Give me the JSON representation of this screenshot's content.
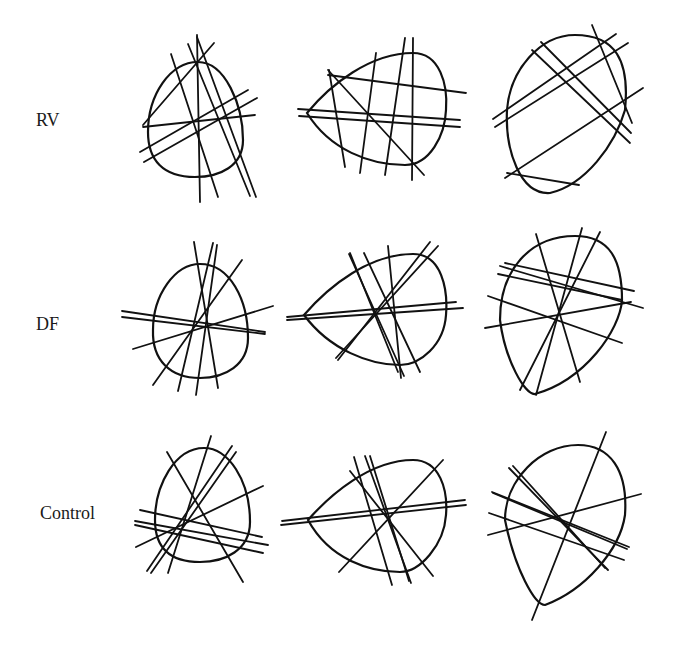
{
  "rows": [
    {
      "label": "RV"
    },
    {
      "label": "DF"
    },
    {
      "label": "Control"
    }
  ],
  "panels": [
    {
      "row": "RV",
      "col": 1,
      "outline": "M198,62 C225,62 243,105 243,140 C243,166 220,177 195,177 C163,177 148,160 148,132 C148,95 170,62 198,62 Z",
      "lines": [
        [
          197,
          35,
          200,
          202
        ],
        [
          171,
          54,
          218,
          197
        ],
        [
          188,
          44,
          250,
          196
        ],
        [
          197,
          37,
          256,
          197
        ],
        [
          143,
          125,
          214,
          43
        ],
        [
          143,
          127,
          255,
          115
        ],
        [
          140,
          152,
          248,
          90
        ],
        [
          144,
          162,
          257,
          98
        ]
      ]
    },
    {
      "row": "RV",
      "col": 2,
      "outline": "M413,53 C440,53 448,85 446,110 C445,135 430,165 405,165 C370,165 330,150 307,113 C330,85 370,53 413,53 Z",
      "lines": [
        [
          329,
          70,
          345,
          167
        ],
        [
          376,
          53,
          360,
          173
        ],
        [
          405,
          38,
          385,
          175
        ],
        [
          413,
          38,
          412,
          180
        ],
        [
          328,
          70,
          424,
          175
        ],
        [
          328,
          75,
          466,
          93
        ],
        [
          298,
          109,
          460,
          120
        ],
        [
          299,
          116,
          460,
          127
        ]
      ]
    },
    {
      "row": "RV",
      "col": 3,
      "outline": "M575,35 C615,35 630,60 625,110 C615,145 585,185 550,193 C520,195 505,150 507,110 C510,70 540,35 575,35 Z",
      "lines": [
        [
          592,
          25,
          632,
          123
        ],
        [
          541,
          42,
          631,
          133
        ],
        [
          532,
          50,
          630,
          143
        ],
        [
          493,
          119,
          616,
          34
        ],
        [
          495,
          127,
          628,
          43
        ],
        [
          505,
          178,
          643,
          88
        ],
        [
          507,
          173,
          579,
          185
        ]
      ]
    },
    {
      "row": "DF",
      "col": 1,
      "outline": "M200,264 C230,264 248,300 248,338 C248,365 225,378 200,378 C170,378 152,360 153,330 C153,295 175,264 200,264 Z",
      "lines": [
        [
          194,
          242,
          218,
          388
        ],
        [
          213,
          243,
          178,
          391
        ],
        [
          217,
          245,
          196,
          395
        ],
        [
          242,
          260,
          153,
          385
        ],
        [
          122,
          311,
          265,
          332
        ],
        [
          122,
          317,
          265,
          334
        ],
        [
          133,
          349,
          273,
          306
        ]
      ]
    },
    {
      "row": "DF",
      "col": 2,
      "outline": "M413,254 C442,254 448,290 446,315 C444,345 420,365 400,365 C370,365 330,350 304,315 C330,285 370,254 413,254 Z",
      "lines": [
        [
          349,
          254,
          404,
          376
        ],
        [
          364,
          253,
          420,
          372
        ],
        [
          350,
          253,
          398,
          372
        ],
        [
          388,
          246,
          401,
          378
        ],
        [
          430,
          242,
          338,
          360
        ],
        [
          438,
          246,
          336,
          358
        ],
        [
          287,
          317,
          456,
          302
        ],
        [
          287,
          320,
          463,
          308
        ]
      ]
    },
    {
      "row": "DF",
      "col": 3,
      "outline": "M575,236 C610,236 622,260 622,300 C620,330 585,380 535,394 C525,395 505,360 500,320 C500,270 530,236 575,236 Z",
      "lines": [
        [
          536,
          234,
          580,
          382
        ],
        [
          582,
          228,
          536,
          395
        ],
        [
          600,
          232,
          520,
          390
        ],
        [
          505,
          263,
          634,
          291
        ],
        [
          500,
          266,
          643,
          308
        ],
        [
          498,
          274,
          622,
          300
        ],
        [
          488,
          296,
          622,
          343
        ],
        [
          485,
          328,
          631,
          302
        ]
      ]
    },
    {
      "row": "Control",
      "col": 1,
      "outline": "M204,448 C228,448 250,480 250,522 C250,550 225,562 200,562 C170,562 155,548 155,520 C155,485 175,448 204,448 Z",
      "lines": [
        [
          211,
          436,
          168,
          573
        ],
        [
          232,
          446,
          147,
          571
        ],
        [
          236,
          452,
          151,
          573
        ],
        [
          167,
          452,
          243,
          582
        ],
        [
          140,
          510,
          262,
          537
        ],
        [
          135,
          521,
          268,
          545
        ],
        [
          136,
          547,
          263,
          486
        ],
        [
          135,
          525,
          263,
          553
        ]
      ]
    },
    {
      "row": "Control",
      "col": 2,
      "outline": "M413,460 C440,460 448,490 446,515 C444,545 420,572 400,572 C370,572 330,560 308,520 C330,495 370,460 413,460 Z",
      "lines": [
        [
          350,
          471,
          433,
          576
        ],
        [
          354,
          457,
          392,
          585
        ],
        [
          365,
          456,
          411,
          583
        ],
        [
          370,
          456,
          409,
          581
        ],
        [
          443,
          460,
          339,
          572
        ],
        [
          282,
          521,
          465,
          500
        ],
        [
          281,
          525,
          466,
          505
        ]
      ]
    },
    {
      "row": "Control",
      "col": 3,
      "outline": "M578,445 C610,445 628,470 625,515 C620,550 585,590 545,605 C535,605 515,570 505,520 C505,480 540,445 578,445 Z",
      "lines": [
        [
          606,
          432,
          532,
          620
        ],
        [
          509,
          468,
          608,
          570
        ],
        [
          513,
          466,
          605,
          568
        ],
        [
          492,
          492,
          629,
          547
        ],
        [
          493,
          493,
          627,
          549
        ],
        [
          489,
          513,
          624,
          560
        ],
        [
          488,
          535,
          641,
          494
        ]
      ]
    }
  ]
}
